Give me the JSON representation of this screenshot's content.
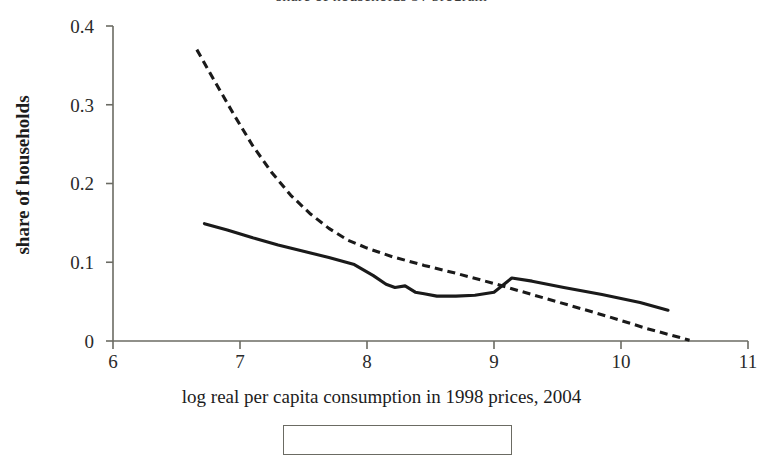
{
  "figure": {
    "clipped_title": "share of households by program",
    "background_color": "#ffffff",
    "line_color": "#1a1a1a",
    "axis_color": "#6b6b63"
  },
  "axes": {
    "ylabel": "share of households",
    "xlabel": "log real per capita consumption in 1998 prices, 2004",
    "xticks": [
      "6",
      "7",
      "8",
      "9",
      "10",
      "11"
    ],
    "yticks": [
      "0",
      "0.1",
      "0.2",
      "0.3",
      "0.4"
    ]
  },
  "chart_data": {
    "type": "line",
    "title": "share of households by program",
    "xlabel": "log real per capita consumption in 1998 prices, 2004",
    "ylabel": "share of households",
    "xlim": [
      6,
      11
    ],
    "ylim": [
      0,
      0.4
    ],
    "xticks": [
      6,
      7,
      8,
      9,
      10,
      11
    ],
    "yticks": [
      0,
      0.1,
      0.2,
      0.3,
      0.4
    ],
    "grid": false,
    "legend_position": "below-axis",
    "series": [
      {
        "name": "solid-curve",
        "style": "solid",
        "color": "#1a1a1a",
        "x": [
          6.72,
          6.9,
          7.1,
          7.3,
          7.5,
          7.7,
          7.9,
          8.05,
          8.15,
          8.22,
          8.3,
          8.38,
          8.45,
          8.55,
          8.7,
          8.85,
          9.0,
          9.14,
          9.3,
          9.55,
          9.85,
          10.15,
          10.37
        ],
        "y": [
          0.149,
          0.141,
          0.131,
          0.122,
          0.114,
          0.106,
          0.097,
          0.083,
          0.072,
          0.068,
          0.07,
          0.062,
          0.06,
          0.057,
          0.057,
          0.058,
          0.062,
          0.08,
          0.076,
          0.068,
          0.059,
          0.049,
          0.039
        ]
      },
      {
        "name": "dashed-curve",
        "style": "dashed",
        "color": "#1a1a1a",
        "x": [
          6.66,
          6.8,
          6.95,
          7.1,
          7.25,
          7.4,
          7.55,
          7.7,
          7.85,
          8.0,
          8.2,
          8.45,
          8.7,
          9.0,
          9.3,
          9.6,
          9.9,
          10.2,
          10.54
        ],
        "y": [
          0.37,
          0.33,
          0.288,
          0.248,
          0.214,
          0.185,
          0.162,
          0.143,
          0.128,
          0.118,
          0.107,
          0.096,
          0.086,
          0.073,
          0.059,
          0.045,
          0.031,
          0.016,
          0.001
        ]
      }
    ]
  }
}
